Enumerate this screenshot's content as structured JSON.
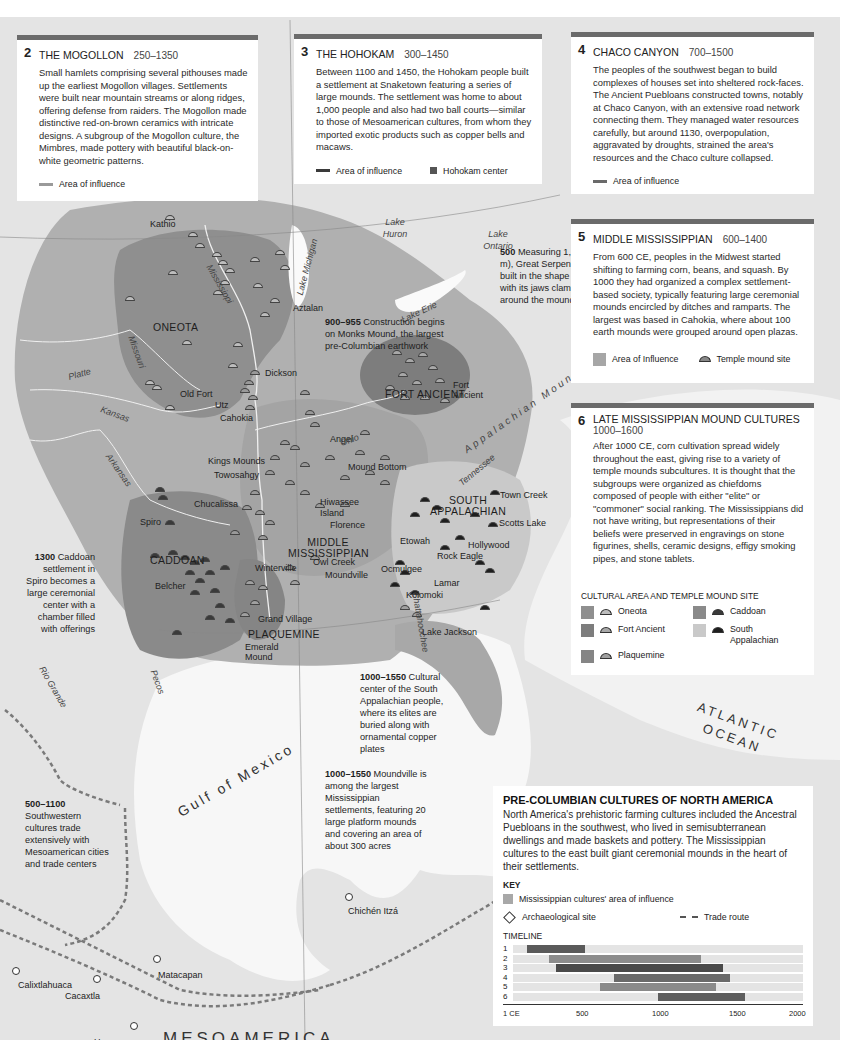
{
  "panels": {
    "mogollon": {
      "number": "2",
      "title": "THE MOGOLLON",
      "dates": "250–1350",
      "body": "Small hamlets comprising several pithouses made up the earliest Mogollon villages. Settlements were built near mountain streams or along ridges, offering defense from raiders. The Mogollon made distinctive red-on-brown ceramics with intricate designs. A subgroup of the Mogollon culture, the Mimbres, made pottery with beautiful black-on-white geometric patterns.",
      "legend": "Area of influence",
      "legend_color": "#9a9a9a"
    },
    "hohokam": {
      "number": "3",
      "title": "THE HOHOKAM",
      "dates": "300–1450",
      "body": "Between 1100 and 1450, the Hohokam people built a settlement at Snaketown featuring a series of large mounds. The settlement was home to about 1,000 people and also had two ball courts—similar to those of Mesoamerican cultures, from whom they imported exotic products such as copper bells and macaws.",
      "legend_area": "Area of influence",
      "legend_center": "Hohokam center",
      "legend_color": "#3a3a3a"
    },
    "chaco": {
      "number": "4",
      "title": "CHACO CANYON",
      "dates": "700–1500",
      "body": "The peoples of the southwest began to build complexes of houses set into sheltered rock-faces. The Ancient Puebloans constructed towns, notably at Chaco Canyon, with an extensive road network connecting them. They managed water resources carefully, but around 1130, overpopulation, aggravated by droughts, strained the area's resources and the Chaco culture collapsed.",
      "legend": "Area of influence",
      "legend_color": "#6a6a6a"
    },
    "middle_miss": {
      "number": "5",
      "title": "MIDDLE MISSISSIPPIAN",
      "dates": "600–1400",
      "body": "From 600 CE, peoples in the Midwest started shifting to farming corn, beans, and squash. By 1000 they had organized a complex settlement-based society, typically featuring large ceremonial mounds encircled by ditches and ramparts. The largest was based in Cahokia, where about 100 earth mounds were grouped around open plazas.",
      "legend_area": "Area of Influence",
      "legend_mound": "Temple mound site"
    },
    "late_miss": {
      "number": "6",
      "title": "LATE MISSISSIPPIAN MOUND CULTURES",
      "dates": "1000–1600",
      "body": "After 1000 CE, corn cultivation spread widely throughout the east, giving rise to a variety of temple mounds subcultures. It is thought that the subgroups were organized as chiefdoms composed of people with either \"elite\" or \"commoner\" social ranking. The Mississippians did not have writing, but representations of their beliefs were preserved in engravings on stone figurines, shells, ceramic designs, effigy smoking pipes, and stone tablets.",
      "legend_heading": "CULTURAL AREA AND TEMPLE MOUND SITE",
      "legend_items": [
        {
          "label": "Oneota",
          "area": "#8f8f8f",
          "mound": "#bdbdbd"
        },
        {
          "label": "Caddoan",
          "area": "#8a8a8a",
          "mound": "#3a3a3a"
        },
        {
          "label": "Fort Ancient",
          "area": "#7d7d7d",
          "mound": "#a8a8a8"
        },
        {
          "label": "South Appalachian",
          "area": "#c9c9c9",
          "mound": "#1e1e1e"
        },
        {
          "label": "Plaquemine",
          "area": "#858585",
          "mound": "#a0a0a0"
        }
      ]
    }
  },
  "key_panel": {
    "title": "PRE-COLUMBIAN CULTURES OF NORTH AMERICA",
    "body": "North America's prehistoric farming cultures included the Ancestral Puebloans in the southwest, who lived in semisubterranean dwellings and made baskets and pottery. The Mississippian cultures to the east built giant ceremonial mounds in the heart of their settlements.",
    "key_heading": "KEY",
    "key_area": "Mississippian cultures' area of influence",
    "key_site": "Archaeological site",
    "key_route": "Trade route",
    "timeline_heading": "TIMELINE",
    "timeline_axis": [
      "1 CE",
      "500",
      "1000",
      "1500",
      "2000"
    ]
  },
  "chart_data": {
    "type": "bar",
    "title": "TIMELINE",
    "orientation": "horizontal-range",
    "categories": [
      "1",
      "2",
      "3",
      "4",
      "5",
      "6"
    ],
    "ranges": [
      [
        100,
        500
      ],
      [
        250,
        1300
      ],
      [
        300,
        1450
      ],
      [
        700,
        1500
      ],
      [
        600,
        1400
      ],
      [
        1000,
        1600
      ]
    ],
    "xlim": [
      1,
      2000
    ],
    "xticks": [
      "1 CE",
      "500",
      "1000",
      "1500",
      "2000"
    ],
    "colors": [
      "#5a5a5a",
      "#8c8c8c",
      "#4a4a4a",
      "#6a6a6a",
      "#8a8a8a",
      "#5e5e5e"
    ]
  },
  "map": {
    "regions": [
      "ONEOTA",
      "FORT ANCIENT",
      "CADDOAN",
      "MIDDLE MISSISSIPPIAN",
      "SOUTH APPALACHIAN",
      "PLAQUEMINE"
    ],
    "sites": [
      "Kathio",
      "Aztalan",
      "Dickson",
      "Old Fort",
      "Utz",
      "Cahokia",
      "Fort Ancient",
      "Angel",
      "Kings Mounds",
      "Towosahgy",
      "Mound Bottom",
      "Chucalissa",
      "Spiro",
      "Hiwassee Island",
      "Florence",
      "Owl Creek",
      "Moundville",
      "Winterville",
      "Belcher",
      "Town Creek",
      "Scotts Lake",
      "Etowah",
      "Hollywood",
      "Rock Eagle",
      "Ocmulgee",
      "Lamar",
      "Kolomoki",
      "Lake Jackson",
      "Grand Village",
      "Emerald Mound",
      "Chichén Itzá",
      "Matacapan",
      "Calixtlahuaca",
      "Cacaxtla",
      "Huaxacoc"
    ],
    "rivers": [
      "Mississippi",
      "Missouri",
      "Platte",
      "Kansas",
      "Arkansas",
      "Ohio",
      "Tennessee",
      "Chattahoochee",
      "Pecos",
      "Rio Grande"
    ],
    "water": [
      "Lake Michigan",
      "Lake Huron",
      "Lake Ontario",
      "Lake Erie",
      "Gulf of Mexico",
      "ATLANTIC OCEAN"
    ],
    "mountains": "Appalachian Mountains",
    "mesoamerica": "MESOAMERICA",
    "annotations": [
      {
        "year": "500",
        "text": "Measuring 1,245 ft (380 m), Great Serpent Mound is built in the shape of a snake with its jaws clamped around the mound"
      },
      {
        "year": "900–955",
        "text": "Construction begins on Monks Mound, the largest pre-Columbian earthwork"
      },
      {
        "year": "1300",
        "text": "Caddoan settlement in Spiro becomes a large ceremonial center with a chamber filled with offerings"
      },
      {
        "year": "1000–1550",
        "text": "Cultural center of the South Appalachian people, where its elites are buried along with ornamental copper plates"
      },
      {
        "year": "1000–1550",
        "text": "Moundville is among the largest Mississippian settlements, featuring 20 large platform mounds and covering an area of about 300 acres"
      },
      {
        "year": "500–1100",
        "text": "Southwestern cultures trade extensively with Mesoamerican cities and trade centers"
      }
    ]
  }
}
